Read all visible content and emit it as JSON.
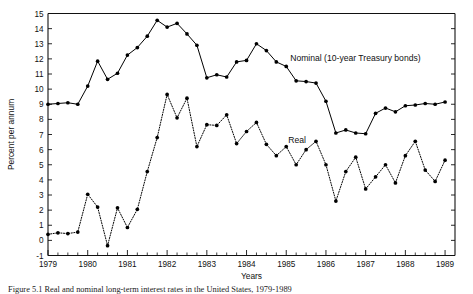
{
  "figure": {
    "caption_fragment": "Figure 5.1    Real and nominal long-term interest rates in the United States, 1979-1989",
    "caption_note": "caption cropped at bottom edge of image"
  },
  "chart_data": {
    "type": "line",
    "title": "",
    "xlabel": "Years",
    "ylabel": "Percent per annum",
    "xlim": [
      1979,
      1989.25
    ],
    "ylim": [
      -1,
      15
    ],
    "ytick_labels": [
      "-1",
      "0",
      "1",
      "2",
      "3",
      "4",
      "5",
      "6",
      "7",
      "8",
      "9",
      "10",
      "11",
      "12",
      "13",
      "14",
      "15"
    ],
    "ytick_values": [
      -1,
      0,
      1,
      2,
      3,
      4,
      5,
      6,
      7,
      8,
      9,
      10,
      11,
      12,
      13,
      14,
      15
    ],
    "xtick_labels": [
      "1979",
      "1980",
      "1981",
      "1982",
      "1983",
      "1984",
      "1985",
      "1986",
      "1987",
      "1988",
      "1989"
    ],
    "xtick_values": [
      1979,
      1980,
      1981,
      1982,
      1983,
      1984,
      1985,
      1986,
      1987,
      1988,
      1989
    ],
    "x_minor_per_major": 4,
    "grid": false,
    "legend_position": "inline-annotation",
    "x": [
      1979,
      1979.25,
      1979.5,
      1979.75,
      1980,
      1980.25,
      1980.5,
      1980.75,
      1981,
      1981.25,
      1981.5,
      1981.75,
      1982,
      1982.25,
      1982.5,
      1982.75,
      1983,
      1983.25,
      1983.5,
      1983.75,
      1984,
      1984.25,
      1984.5,
      1984.75,
      1985,
      1985.25,
      1985.5,
      1985.75,
      1986,
      1986.25,
      1986.5,
      1986.75,
      1987,
      1987.25,
      1987.5,
      1987.75,
      1988,
      1988.25,
      1988.5,
      1988.75,
      1989
    ],
    "series": [
      {
        "name": "Nominal (10-year Treasury bonds)",
        "label": "Nominal (10-year Treasury bonds)",
        "style": "solid",
        "values": [
          9.0,
          9.05,
          9.1,
          9.0,
          10.2,
          11.85,
          10.65,
          11.05,
          12.25,
          12.75,
          13.5,
          14.55,
          14.1,
          14.35,
          13.65,
          12.9,
          10.75,
          10.95,
          10.8,
          11.8,
          11.9,
          13.0,
          12.55,
          11.8,
          11.5,
          10.55,
          10.5,
          10.4,
          9.2,
          7.1,
          7.3,
          7.1,
          7.05,
          8.4,
          8.75,
          8.5,
          8.9,
          8.95,
          9.05,
          9.0,
          9.15
        ]
      },
      {
        "name": "Real",
        "label": "Real",
        "style": "dotted",
        "values": [
          0.4,
          0.5,
          0.45,
          0.55,
          3.05,
          2.2,
          -0.35,
          2.15,
          0.85,
          2.05,
          4.55,
          6.8,
          9.65,
          8.1,
          9.4,
          6.2,
          7.65,
          7.6,
          8.3,
          6.4,
          7.2,
          7.8,
          6.35,
          5.6,
          6.2,
          5.0,
          6.0,
          6.55,
          5.0,
          2.6,
          4.55,
          5.5,
          3.4,
          4.2,
          5.0,
          3.8,
          5.6,
          6.55,
          4.65,
          3.9,
          5.3
        ]
      }
    ],
    "annotations": [
      {
        "name": "nominal-label",
        "text": "Nominal (10-year Treasury bonds)",
        "x": 1985.1,
        "y": 11.85
      },
      {
        "name": "real-label",
        "text": "Real",
        "x": 1985.05,
        "y": 6.45
      }
    ]
  }
}
